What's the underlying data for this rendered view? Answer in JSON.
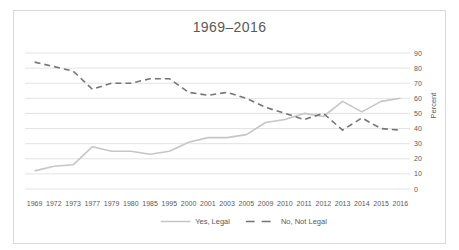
{
  "colors": {
    "series_yes": "#c6c6c6",
    "series_no": "#757575",
    "gridline": "#dcdcdc",
    "text": "#595959",
    "frame_border": "#d9d9d9",
    "background": "#ffffff"
  },
  "chart_data": {
    "type": "line",
    "title": "1969–2016",
    "categories": [
      "1969",
      "1972",
      "1973",
      "1977",
      "1979",
      "1980",
      "1985",
      "1995",
      "2000",
      "2001",
      "2003",
      "2005",
      "2009",
      "2010",
      "2011",
      "2012",
      "2013",
      "2014",
      "2015",
      "2016"
    ],
    "series": [
      {
        "name": "Yes, Legal",
        "style": "solid",
        "values": [
          12,
          15,
          16,
          28,
          25,
          25,
          23,
          25,
          31,
          34,
          34,
          36,
          44,
          46,
          50,
          48,
          58,
          51,
          58,
          60
        ]
      },
      {
        "name": "No, Not Legal",
        "style": "dashed",
        "values": [
          84,
          81,
          78,
          66,
          70,
          70,
          73,
          73,
          64,
          62,
          64,
          60,
          54,
          50,
          46,
          50,
          39,
          47,
          40,
          39
        ]
      }
    ],
    "xlabel": "",
    "ylabel": "Percent",
    "ylim": [
      0,
      90
    ],
    "yticks": [
      0,
      10,
      20,
      30,
      40,
      50,
      60,
      70,
      80,
      90
    ],
    "y_axis_side": "right",
    "grid": "horizontal",
    "legend_position": "bottom"
  }
}
